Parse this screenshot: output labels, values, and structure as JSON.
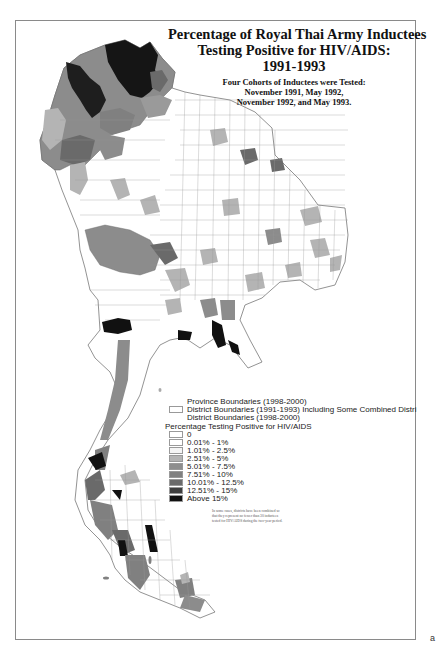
{
  "title": {
    "lines": [
      "Percentage of Royal Thai Army Inductees",
      "Testing Positive for HIV/AIDS:",
      "1991-1993"
    ],
    "subtitle_lines": [
      "Four Cohorts of Inductees were Tested:",
      "November 1991, May 1992,",
      "November 1992, and May 1993."
    ]
  },
  "legend": {
    "boundaries": [
      {
        "label": "Province Boundaries (1998-2000)",
        "swatch": "none"
      },
      {
        "label": "District Boundaries (1991-1993)  Including Some Combined Distri",
        "swatch": "box"
      },
      {
        "label": "District Boundaries (1998-2000)",
        "swatch": "none"
      }
    ],
    "heading": "Percentage Testing Positive for HIV/AIDS",
    "classes": [
      {
        "label": "0",
        "color": "#ffffff"
      },
      {
        "label": "0.01% - 1%",
        "color": "#ffffff"
      },
      {
        "label": "1.01% - 2.5%",
        "color": "#f4f4f4"
      },
      {
        "label": "2.51% - 5%",
        "color": "#b4b4b4"
      },
      {
        "label": "5.01% - 7.5%",
        "color": "#8e8e8e"
      },
      {
        "label": "7.51% - 10%",
        "color": "#808080"
      },
      {
        "label": "10.01% - 12.5%",
        "color": "#6a6a6a"
      },
      {
        "label": "12.51% - 15%",
        "color": "#3e3e3e"
      },
      {
        "label": "Above 15%",
        "color": "#111111"
      }
    ],
    "footnote": "In some cases, districts have been combined so that they represent no fewer than 30 inductees tested for HIV/AIDS during the two-year period."
  },
  "credit": "",
  "corner_mark": "a"
}
